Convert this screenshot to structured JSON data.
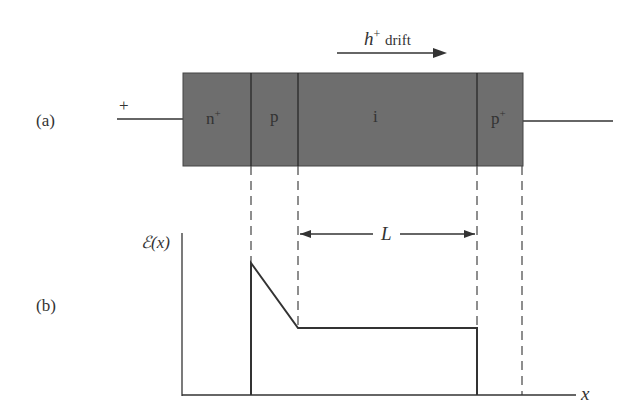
{
  "panel_a": {
    "label": "(a)",
    "left_terminal": "+",
    "drift_label": "h",
    "drift_sup": "+",
    "drift_word": "drift",
    "regions": [
      {
        "name": "n",
        "sup": "+"
      },
      {
        "name": "p",
        "sup": ""
      },
      {
        "name": "i",
        "sup": ""
      },
      {
        "name": "p",
        "sup": "+"
      }
    ]
  },
  "panel_b": {
    "label": "(b)",
    "y_axis_label": "ℰ(x)",
    "x_axis_label": "x",
    "length_label": "L"
  },
  "colors": {
    "device_fill": "#6e6e6e",
    "line": "#333333"
  }
}
